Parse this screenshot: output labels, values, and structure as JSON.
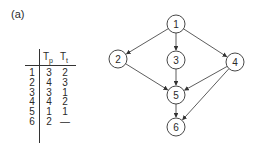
{
  "panel_label": "(a)",
  "table": {
    "columns": [
      {
        "main": "T",
        "sub": "p"
      },
      {
        "main": "T",
        "sub": "t"
      }
    ],
    "rows": [
      {
        "id": "1",
        "tp": "3",
        "tt": "2"
      },
      {
        "id": "2",
        "tp": "4",
        "tt": "3"
      },
      {
        "id": "3",
        "tp": "3",
        "tt": "1"
      },
      {
        "id": "4",
        "tp": "4",
        "tt": "2"
      },
      {
        "id": "5",
        "tp": "1",
        "tt": "1"
      },
      {
        "id": "6",
        "tp": "2",
        "tt": "—"
      }
    ]
  },
  "graph": {
    "nodes": [
      {
        "id": "1",
        "label": "1",
        "x": 176,
        "y": 24
      },
      {
        "id": "2",
        "label": "2",
        "x": 118,
        "y": 59
      },
      {
        "id": "3",
        "label": "3",
        "x": 176,
        "y": 60
      },
      {
        "id": "4",
        "label": "4",
        "x": 235,
        "y": 62
      },
      {
        "id": "5",
        "label": "5",
        "x": 176,
        "y": 95
      },
      {
        "id": "6",
        "label": "6",
        "x": 176,
        "y": 127
      }
    ],
    "edges": [
      {
        "from": "1",
        "to": "2"
      },
      {
        "from": "1",
        "to": "3"
      },
      {
        "from": "1",
        "to": "4"
      },
      {
        "from": "2",
        "to": "5"
      },
      {
        "from": "3",
        "to": "5"
      },
      {
        "from": "4",
        "to": "5"
      },
      {
        "from": "4",
        "to": "6"
      },
      {
        "from": "5",
        "to": "6"
      }
    ],
    "node_radius": 9
  }
}
